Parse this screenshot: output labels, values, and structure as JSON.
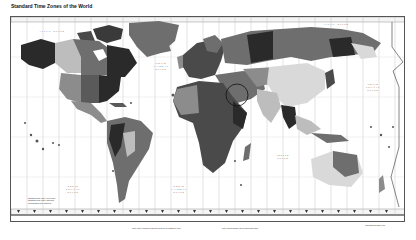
{
  "title": "Standard Time Zones of the World",
  "map": {
    "type": "world-time-zone-map",
    "ocean_labels": [
      {
        "id": "arctic",
        "text": "Arctic Ocean",
        "x": 30,
        "y": 20
      },
      {
        "id": "north-atlantic",
        "text": "North Atlantic Ocean",
        "x": 146,
        "y": 56
      },
      {
        "id": "south-pacific-west",
        "text": "South Pacific Ocean",
        "x": 58,
        "y": 178
      },
      {
        "id": "south-atlantic",
        "text": "South Atlantic Ocean",
        "x": 163,
        "y": 178
      },
      {
        "id": "indian",
        "text": "Indian Ocean",
        "x": 270,
        "y": 147
      },
      {
        "id": "north-pacific",
        "text": "North Pacific Ocean",
        "x": 362,
        "y": 80
      },
      {
        "id": "arctic-east",
        "text": "Arctic Ocean",
        "x": 325,
        "y": 14
      }
    ],
    "colors": {
      "zone_dark": "#2a2a2a",
      "zone_mid": "#6e6e6e",
      "zone_gray": "#8c8c8c",
      "zone_light": "#bdbdbd",
      "zone_pale": "#d9d9d9",
      "grid": "#b5b5b5",
      "frame": "#555555"
    }
  },
  "legend": {
    "line1": "Standard time zone: even hour",
    "line2": "Standard time zone: half hour",
    "line3": "No standard time adopted"
  },
  "footer": {
    "note1": "Time zone numbers indicate hours to be added to UTC",
    "note2": "Time zones shown as of publication date",
    "note3": "International Date Line"
  }
}
